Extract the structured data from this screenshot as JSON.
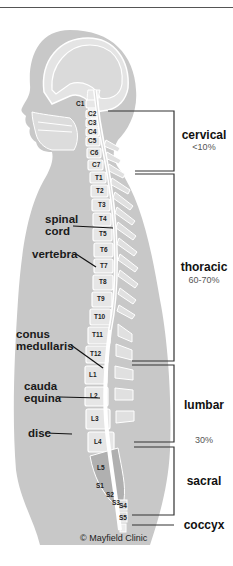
{
  "diagram": {
    "credit": "© Mayfield Clinic",
    "colors": {
      "body_silhouette": "#c8c8c8",
      "vertebra_fill": "#e6e6e6",
      "sacrum_fill": "#b0b0b0",
      "spinal_cord": "#ffffff",
      "bracket_lines": "#333333",
      "label_text": "#111111",
      "percent_text": "#555555"
    },
    "vertebrae": {
      "cervical": [
        "C1",
        "C2",
        "C3",
        "C4",
        "C5",
        "C6",
        "C7"
      ],
      "thoracic": [
        "T1",
        "T2",
        "T3",
        "T4",
        "T5",
        "T6",
        "T7",
        "T8",
        "T9",
        "T10",
        "T11",
        "T12"
      ],
      "lumbar": [
        "L1",
        "L2",
        "L3",
        "L4",
        "L5"
      ],
      "sacral": [
        "S1",
        "S2",
        "S3",
        "S4",
        "S5"
      ]
    },
    "anatomy_labels": {
      "spinal_cord_1": "spinal",
      "spinal_cord_2": "cord",
      "vertebra": "vertebra",
      "conus_1": "conus",
      "conus_2": "medullaris",
      "cauda_1": "cauda",
      "cauda_2": "equina",
      "disc": "disc"
    },
    "regions": [
      {
        "name": "cervical",
        "percent": "<10%"
      },
      {
        "name": "thoracic",
        "percent": "60-70%"
      },
      {
        "name": "lumbar",
        "percent": "30%"
      },
      {
        "name": "sacral",
        "percent": ""
      },
      {
        "name": "coccyx",
        "percent": ""
      }
    ]
  }
}
